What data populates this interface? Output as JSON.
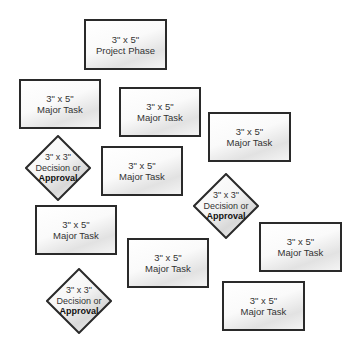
{
  "diagram": {
    "cards": [
      {
        "id": "project-phase",
        "size": "3\" x 5\"",
        "label": "Project Phase",
        "x": 84,
        "y": 19,
        "w": 83,
        "h": 51
      },
      {
        "id": "task-1",
        "size": "3\" x 5\"",
        "label": "Major Task",
        "x": 19,
        "y": 79,
        "w": 82,
        "h": 50
      },
      {
        "id": "task-2",
        "size": "3\" x 5\"",
        "label": "Major Task",
        "x": 119,
        "y": 87,
        "w": 82,
        "h": 50
      },
      {
        "id": "task-3",
        "size": "3\" x 5\"",
        "label": "Major Task",
        "x": 208,
        "y": 112,
        "w": 83,
        "h": 50
      },
      {
        "id": "task-4",
        "size": "3\" x 5\"",
        "label": "Major Task",
        "x": 101,
        "y": 146,
        "w": 82,
        "h": 50
      },
      {
        "id": "task-5",
        "size": "3\" x 5\"",
        "label": "Major Task",
        "x": 35,
        "y": 205,
        "w": 82,
        "h": 50
      },
      {
        "id": "task-6",
        "size": "3\" x 5\"",
        "label": "Major Task",
        "x": 127,
        "y": 238,
        "w": 82,
        "h": 50
      },
      {
        "id": "task-7",
        "size": "3\" x 5\"",
        "label": "Major Task",
        "x": 259,
        "y": 222,
        "w": 83,
        "h": 50
      },
      {
        "id": "task-8",
        "size": "3\" x 5\"",
        "label": "Major Task",
        "x": 222,
        "y": 281,
        "w": 83,
        "h": 50
      }
    ],
    "diamonds": [
      {
        "id": "decision-1",
        "size": "3\" x 3\"",
        "line1": "Decision or",
        "line2": "Approval",
        "x": 25,
        "y": 135
      },
      {
        "id": "decision-2",
        "size": "3\" x 3\"",
        "line1": "Decision or",
        "line2": "Approval",
        "x": 193,
        "y": 173
      },
      {
        "id": "decision-3",
        "size": "3\" x 3\"",
        "line1": "Decision or",
        "line2": "Approval",
        "x": 46,
        "y": 268
      }
    ]
  }
}
